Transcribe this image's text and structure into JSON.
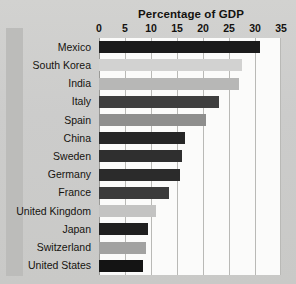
{
  "chart_data": {
    "type": "bar",
    "orientation": "horizontal",
    "title": "Percentage of GDP",
    "xlabel": "",
    "ylabel": "",
    "xlim": [
      0,
      35
    ],
    "xticks": [
      0,
      5,
      10,
      15,
      20,
      25,
      30,
      35
    ],
    "xtick_labels": [
      "0",
      "5",
      "10",
      "15",
      "20",
      "25",
      "30",
      "35"
    ],
    "grid": true,
    "legend": "none",
    "categories": [
      "Mexico",
      "South Korea",
      "India",
      "Italy",
      "Spain",
      "China",
      "Sweden",
      "Germany",
      "France",
      "United Kingdom",
      "Japan",
      "Switzerland",
      "United States"
    ],
    "values": [
      31.0,
      27.5,
      27.0,
      23.0,
      20.5,
      16.5,
      16.0,
      15.5,
      13.5,
      11.0,
      9.5,
      9.0,
      8.5
    ],
    "bar_colors": [
      "#1b1b1b",
      "#d2d2d1",
      "#b7b7b6",
      "#3e3e3e",
      "#8e8e8d",
      "#262626",
      "#2f2f2f",
      "#2b2b2b",
      "#3b3b3b",
      "#c3c3c2",
      "#1f1f1f",
      "#a2a2a1",
      "#141414"
    ]
  },
  "colors": {
    "page_background": "#cdcdcb",
    "gutter_band": "#bcbcba",
    "plot_background": "#fbfbfa",
    "gridline": "#b9b9b6",
    "text": "#14120f"
  }
}
